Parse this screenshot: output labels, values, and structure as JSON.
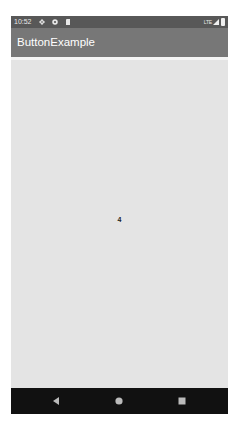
{
  "status_bar": {
    "time": "10:52",
    "network": "LTE",
    "icons": [
      "gear-icon",
      "shield-icon",
      "sdcard-icon",
      "signal-icon",
      "battery-icon"
    ]
  },
  "app_bar": {
    "title": "ButtonExample"
  },
  "content": {
    "counter_value": "4"
  },
  "nav_bar": {
    "buttons": [
      "back",
      "home",
      "recents"
    ]
  },
  "colors": {
    "status_bar": "#585858",
    "app_bar": "#777777",
    "content_bg": "#e4e4e4",
    "nav_bar": "#111111"
  }
}
